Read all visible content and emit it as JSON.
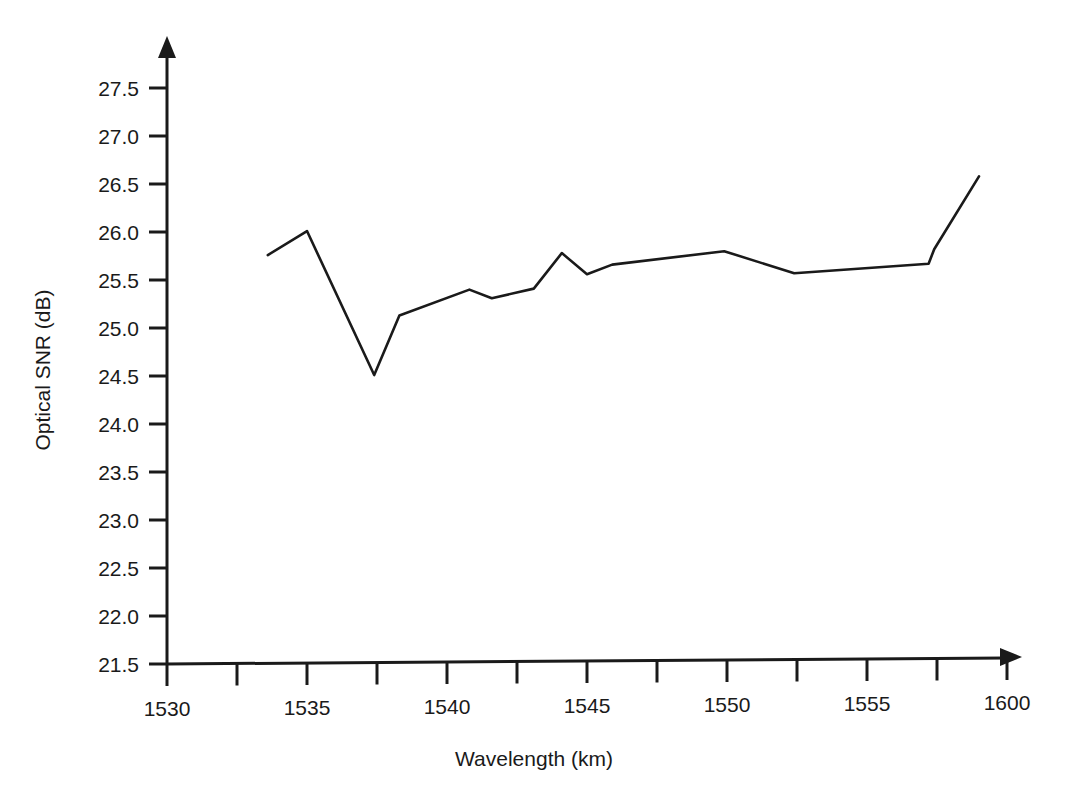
{
  "chart_data": {
    "type": "line",
    "title": "",
    "xlabel": "Wavelength (km)",
    "ylabel": "Optical SNR (dB)",
    "xlim": [
      1528.75,
      1558.75
    ],
    "ylim": [
      21.5,
      27.5
    ],
    "grid": false,
    "legend": null,
    "x_tick_labels": [
      "1530",
      "1535",
      "1540",
      "1545",
      "1550",
      "1555",
      "1600"
    ],
    "x_tick_values": [
      1530,
      1535,
      1540,
      1545,
      1550,
      1555,
      1600
    ],
    "x_minor_tick_count": 6,
    "y_tick_labels": [
      "21.5",
      "22.0",
      "22.5",
      "23.0",
      "23.5",
      "24.0",
      "24.5",
      "25.0",
      "25.5",
      "26.0",
      "26.5",
      "27.0",
      "27.5"
    ],
    "y_tick_values": [
      21.5,
      22.0,
      22.5,
      23.0,
      23.5,
      24.0,
      24.5,
      25.0,
      25.5,
      26.0,
      26.5,
      27.0,
      27.5
    ],
    "series": [
      {
        "name": "Optical SNR",
        "color": "#1a1a1a",
        "x": [
          1533.6,
          1535.0,
          1537.4,
          1538.3,
          1540.8,
          1541.6,
          1543.1,
          1544.1,
          1545.0,
          1545.9,
          1549.9,
          1552.4,
          1557.2,
          1557.4,
          1559.0
        ],
        "values": [
          25.76,
          26.01,
          24.51,
          25.13,
          25.4,
          25.31,
          25.41,
          25.78,
          25.56,
          25.66,
          25.8,
          25.57,
          25.67,
          25.82,
          26.58
        ]
      }
    ]
  },
  "axis": {
    "x_axis_arrow": true,
    "y_axis_arrow": true,
    "axis_color": "#1a1a1a"
  }
}
